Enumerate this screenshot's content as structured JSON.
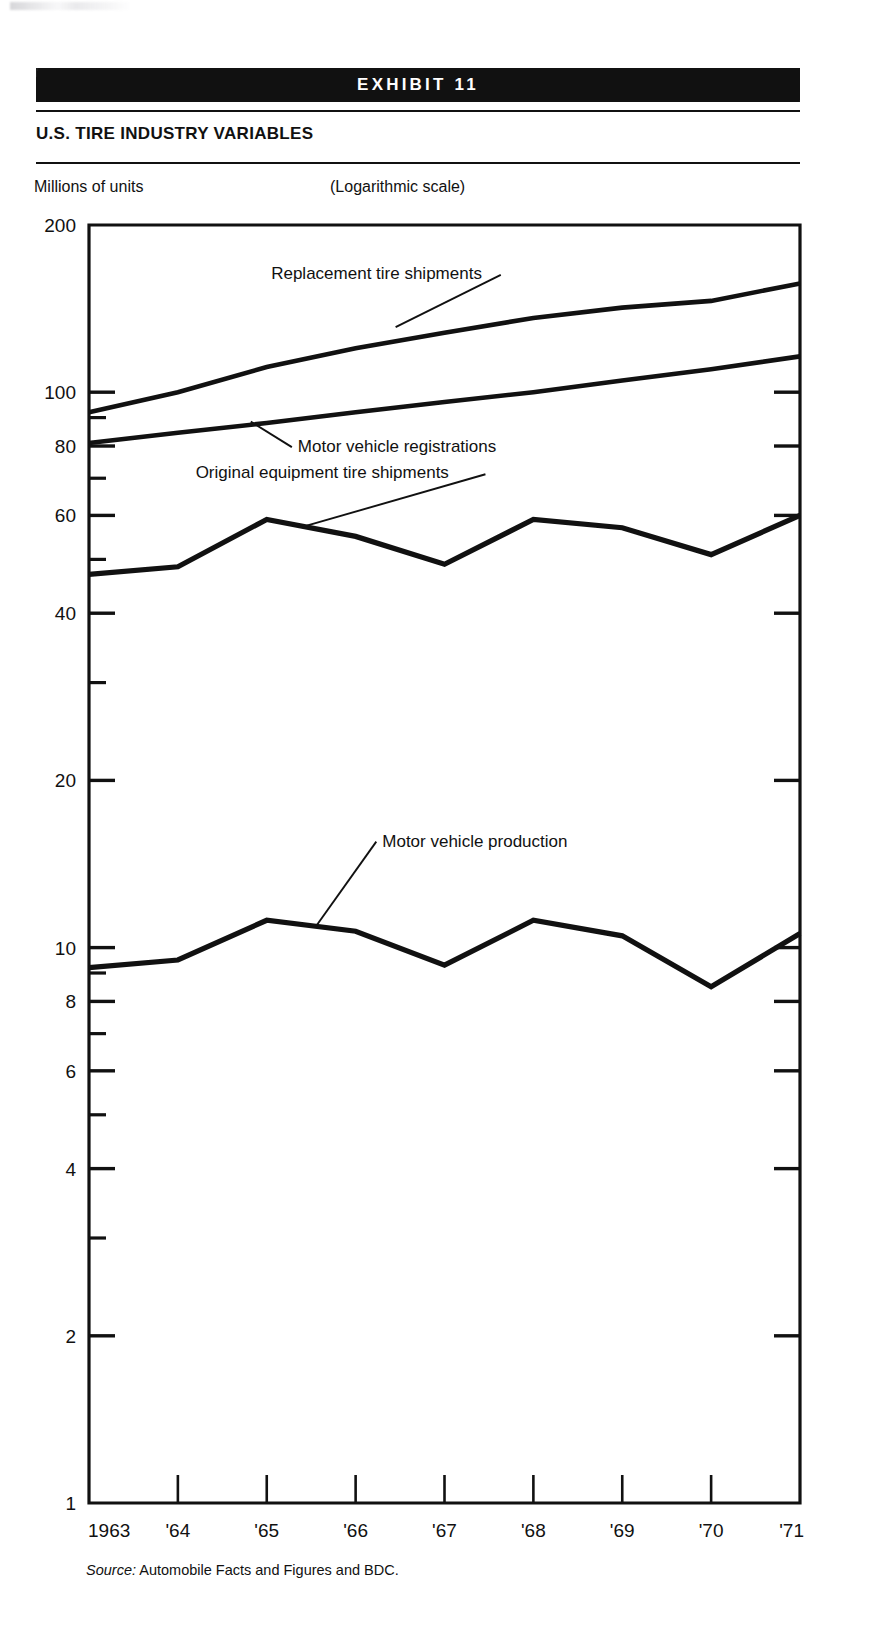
{
  "exhibit": {
    "band_label": "EXHIBIT 11",
    "title": "U.S. TIRE INDUSTRY VARIABLES"
  },
  "axis_unit_label": "Millions of units",
  "scale_note": "(Logarithmic scale)",
  "source": {
    "prefix": "Source:",
    "text": "Automobile Facts and Figures and BDC."
  },
  "chart_data": {
    "type": "line",
    "title": "U.S. TIRE INDUSTRY VARIABLES",
    "subtitle": "(Logarithmic scale)",
    "xlabel": "",
    "ylabel": "Millions of units",
    "yscale": "log",
    "ylim": [
      1,
      200
    ],
    "grid": false,
    "legend": "inline-annotations",
    "x": [
      1963,
      1964,
      1965,
      1966,
      1967,
      1968,
      1969,
      1970,
      1971
    ],
    "xtick_labels": [
      "1963",
      "'64",
      "'65",
      "'66",
      "'67",
      "'68",
      "'69",
      "'70",
      "'71"
    ],
    "ytick_labels": [
      "200",
      "100",
      "80",
      "60",
      "40",
      "20",
      "10",
      "8",
      "6",
      "4",
      "2",
      "1"
    ],
    "ytick_values": [
      200,
      100,
      80,
      60,
      40,
      20,
      10,
      8,
      6,
      4,
      2,
      1
    ],
    "yminor_values": [
      90,
      70,
      50,
      30,
      9,
      7,
      5,
      3
    ],
    "series": [
      {
        "name": "Replacement tire shipments",
        "values": [
          92,
          100,
          111,
          120,
          128,
          136,
          142,
          146,
          157
        ],
        "label_x": 1965.05,
        "label_y": 160,
        "leader_to_x": 1966.45,
        "leader_to_y": 131
      },
      {
        "name": "Motor vehicle registrations",
        "values": [
          81,
          84.5,
          88,
          92,
          96,
          100,
          105,
          110,
          116
        ],
        "label_x": 1965.35,
        "label_y": 78,
        "leader_to_x": 1964.82,
        "leader_to_y": 88.5
      },
      {
        "name": "Original equipment tire shipments",
        "values": [
          47,
          48.5,
          59,
          55,
          49,
          59,
          57,
          51,
          60
        ],
        "label_x": 1964.2,
        "label_y": 70,
        "leader_to_x": 1965.45,
        "leader_to_y": 57.5
      },
      {
        "name": "Motor vehicle production",
        "values": [
          9.2,
          9.5,
          11.2,
          10.7,
          9.3,
          11.2,
          10.5,
          8.5,
          10.6
        ],
        "label_x": 1966.3,
        "label_y": 15.2,
        "leader_to_x": 1965.55,
        "leader_to_y": 10.9
      }
    ]
  }
}
